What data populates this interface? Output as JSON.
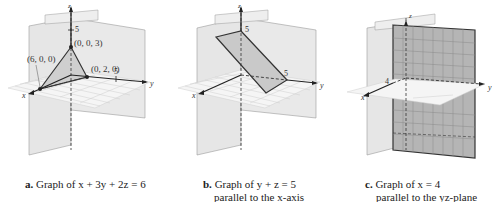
{
  "figure": {
    "panels": [
      {
        "id": "a",
        "caption_letter": "a.",
        "caption_text": " Graph of x + 3y + 2z = 6",
        "caption_line2": "",
        "equation": "x + 3y + 2z = 6",
        "axis_labels": {
          "x": "x",
          "y": "y",
          "z": "z"
        },
        "ticks": {
          "z": "5",
          "y": "5"
        },
        "points": [
          {
            "label": "(6, 0, 0)"
          },
          {
            "label": "(0, 2, 0)"
          },
          {
            "label": "(0, 0, 3)"
          }
        ]
      },
      {
        "id": "b",
        "caption_letter": "b.",
        "caption_text": " Graph of y + z = 5",
        "caption_line2": "parallel to the x-axis",
        "equation": "y + z = 5",
        "axis_labels": {
          "x": "x",
          "y": "y",
          "z": "z"
        },
        "ticks": {
          "z": "5",
          "y": "5"
        }
      },
      {
        "id": "c",
        "caption_letter": "c.",
        "caption_text": " Graph of x = 4",
        "caption_line2": "parallel to the yz-plane",
        "equation": "x = 4",
        "axis_labels": {
          "x": "x",
          "y": "y",
          "z": "z"
        },
        "ticks": {
          "x": "4"
        }
      }
    ],
    "colors": {
      "wall": "#e4e4e4",
      "wall_edge": "#9a9a9a",
      "grid": "#c8c8c8",
      "plane_a": "#cfcfcf",
      "plane_b": "#c9c9c9",
      "plane_c": "#b5b5b5",
      "axis": "#222222"
    }
  }
}
